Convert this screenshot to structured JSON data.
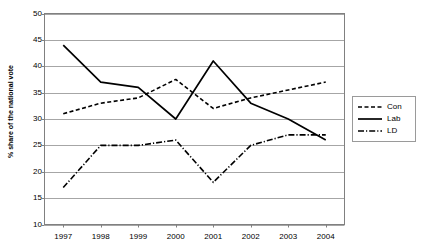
{
  "chart_data": {
    "type": "line",
    "title": "",
    "xlabel": "",
    "ylabel": "% share of the national vote",
    "categories": [
      "1997",
      "1998",
      "1999",
      "2000",
      "2001",
      "2002",
      "2003",
      "2004"
    ],
    "x": [
      1997,
      1998,
      1999,
      2000,
      2001,
      2002,
      2003,
      2004
    ],
    "ylim": [
      10,
      50
    ],
    "yticks": [
      10,
      15,
      20,
      25,
      30,
      35,
      40,
      45,
      50
    ],
    "ytick_labels": [
      "10",
      "15",
      "20",
      "25",
      "30",
      "35",
      "40",
      "45",
      "50"
    ],
    "grid": "horizontal",
    "legend_position": "right",
    "series": [
      {
        "name": "Con",
        "style": "dashed",
        "color": "#000000",
        "values": [
          31,
          33,
          34,
          37.5,
          32,
          34,
          35.5,
          37
        ]
      },
      {
        "name": "Lab",
        "style": "solid",
        "color": "#000000",
        "values": [
          44,
          37,
          36,
          30,
          41,
          33,
          30,
          26
        ]
      },
      {
        "name": "LD",
        "style": "dash-dot",
        "color": "#000000",
        "values": [
          17,
          25,
          25,
          26,
          18,
          25,
          27,
          27
        ]
      }
    ]
  },
  "legend": {
    "entries": [
      {
        "label": "Con"
      },
      {
        "label": "Lab"
      },
      {
        "label": "LD"
      }
    ]
  },
  "colors": {
    "series": "#000000",
    "gridline": "#a6a6a6",
    "axis": "#808080",
    "background": "#ffffff"
  }
}
